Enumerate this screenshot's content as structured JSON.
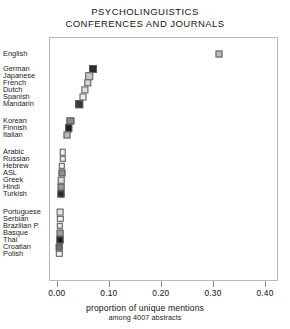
{
  "chart": {
    "title_lines": [
      "PSYCHOLINGUISTICS",
      "CONFERENCES AND JOURNALS"
    ],
    "xlabel_main": "proportion of unique mentions",
    "xlabel_sub": "among 4007 abstracts",
    "tick_labels": [
      "0.00",
      "0.10",
      "0.20",
      "0.30",
      "0.40"
    ]
  },
  "chart_data": {
    "type": "scatter",
    "title": "PSYCHOLINGUISTICS CONFERENCES AND JOURNALS",
    "subtitle": "",
    "xlabel": "proportion of unique mentions among 4007 abstracts",
    "ylabel": "",
    "xlim": [
      -0.015,
      0.425
    ],
    "xticks": [
      0.0,
      0.1,
      0.2,
      0.3,
      0.4
    ],
    "xticklabels": [
      "0.00",
      "0.10",
      "0.20",
      "0.30",
      "0.40"
    ],
    "grid": false,
    "legend": "none",
    "orientation": "horizontal-dotplot",
    "categories": [
      "English",
      "German",
      "Japanese",
      "French",
      "Dutch",
      "Spanish",
      "Mandarin",
      "Korean",
      "Finnish",
      "Italian",
      "Arabic",
      "Russian",
      "Hebrew",
      "ASL",
      "Greek",
      "Hindi",
      "Turkish",
      "Portuguese",
      "Serbian",
      "Brazilian P.",
      "Basque",
      "Thai",
      "Croatian",
      "Polish"
    ],
    "values": [
      0.312,
      0.069,
      0.062,
      0.059,
      0.054,
      0.05,
      0.043,
      0.026,
      0.023,
      0.019,
      0.011,
      0.011,
      0.01,
      0.01,
      0.009,
      0.008,
      0.008,
      0.007,
      0.007,
      0.006,
      0.006,
      0.006,
      0.005,
      0.005
    ],
    "points": [
      {
        "label": "English",
        "value": 0.312,
        "shade": "#bdbdbd",
        "size": 7.0
      },
      {
        "label": "German",
        "value": 0.069,
        "shade": "#2c2c2c",
        "size": 8.0
      },
      {
        "label": "Japanese",
        "value": 0.062,
        "shade": "#c7c7c7",
        "size": 7.6
      },
      {
        "label": "French",
        "value": 0.059,
        "shade": "#d4d4d4",
        "size": 7.4
      },
      {
        "label": "Dutch",
        "value": 0.054,
        "shade": "#e0e0e0",
        "size": 7.2
      },
      {
        "label": "Spanish",
        "value": 0.05,
        "shade": "#ededed",
        "size": 7.0
      },
      {
        "label": "Mandarin",
        "value": 0.043,
        "shade": "#3a3a3a",
        "size": 7.6
      },
      {
        "label": "Korean",
        "value": 0.026,
        "shade": "#8c8c8c",
        "size": 7.2
      },
      {
        "label": "Finnish",
        "value": 0.023,
        "shade": "#1f1f1f",
        "size": 7.6
      },
      {
        "label": "Italian",
        "value": 0.019,
        "shade": "#bdbdbd",
        "size": 7.0
      },
      {
        "label": "Arabic",
        "value": 0.011,
        "shade": "#efefef",
        "size": 6.6
      },
      {
        "label": "Russian",
        "value": 0.011,
        "shade": "#e8e8e8",
        "size": 6.4
      },
      {
        "label": "Hebrew",
        "value": 0.01,
        "shade": "#ededed",
        "size": 6.4
      },
      {
        "label": "ASL",
        "value": 0.01,
        "shade": "#8f8f8f",
        "size": 7.0
      },
      {
        "label": "Greek",
        "value": 0.009,
        "shade": "#dcdcdc",
        "size": 6.6
      },
      {
        "label": "Hindi",
        "value": 0.008,
        "shade": "#9a9a9a",
        "size": 6.8
      },
      {
        "label": "Turkish",
        "value": 0.008,
        "shade": "#2a2a2a",
        "size": 7.0
      },
      {
        "label": "Portuguese",
        "value": 0.007,
        "shade": "#e6e6e6",
        "size": 6.8
      },
      {
        "label": "Serbian",
        "value": 0.007,
        "shade": "#f0f0f0",
        "size": 6.4
      },
      {
        "label": "Brazilian P.",
        "value": 0.006,
        "shade": "#e2e2e2",
        "size": 6.4
      },
      {
        "label": "Basque",
        "value": 0.006,
        "shade": "#9d9d9d",
        "size": 6.8
      },
      {
        "label": "Thai",
        "value": 0.006,
        "shade": "#1c1c1c",
        "size": 7.0
      },
      {
        "label": "Croatian",
        "value": 0.005,
        "shade": "#6e6e6e",
        "size": 6.6
      },
      {
        "label": "Polish",
        "value": 0.005,
        "shade": "#efefef",
        "size": 6.4
      }
    ],
    "row_y_px": [
      54,
      69,
      76,
      83,
      90,
      97,
      104,
      121,
      128,
      135,
      152,
      159,
      166,
      173,
      180,
      187,
      194,
      212,
      219,
      226,
      233,
      240,
      247,
      254
    ]
  },
  "colors": {
    "frame": "#b9b9b9",
    "text": "#151515",
    "marker_edge": "#5a5a5a"
  }
}
